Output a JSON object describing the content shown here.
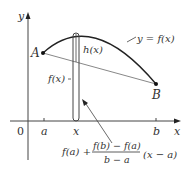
{
  "diagram": {
    "axes": {
      "x_label": "x",
      "y_label": "y",
      "origin_label": "0"
    },
    "ticks": {
      "a": "a",
      "x": "x",
      "b": "b"
    },
    "points": {
      "A": "A",
      "B": "B"
    },
    "labels": {
      "curve": "y = f(x)",
      "h": "h(x)",
      "fx": "f(x)",
      "formula_prefix": "f(a) +",
      "formula_numerator": "f(b) − f(a)",
      "formula_denominator": "b − a",
      "formula_suffix": "(x − a)"
    },
    "colors": {
      "curve": "#222222",
      "secant": "#888888",
      "axes": "#444444",
      "text": "#333333"
    }
  }
}
